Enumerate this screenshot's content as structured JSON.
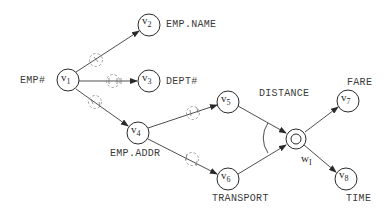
{
  "diagram": {
    "type": "semantic-network",
    "nodes": [
      {
        "id": "v1",
        "label": "v",
        "sub": "1",
        "annotation": "EMP#"
      },
      {
        "id": "v2",
        "label": "v",
        "sub": "2",
        "annotation": "EMP.NAME"
      },
      {
        "id": "v3",
        "label": "v",
        "sub": "3",
        "annotation": "DEPT#"
      },
      {
        "id": "v4",
        "label": "v",
        "sub": "4",
        "annotation": "EMP.ADDR"
      },
      {
        "id": "v5",
        "label": "v",
        "sub": "5",
        "annotation": ""
      },
      {
        "id": "v6",
        "label": "v",
        "sub": "6",
        "annotation": "TRANSPORT"
      },
      {
        "id": "wI",
        "label": "w",
        "sub": "I",
        "annotation": ""
      },
      {
        "id": "v7",
        "label": "v",
        "sub": "7",
        "annotation": "FARE"
      },
      {
        "id": "v8",
        "label": "v",
        "sub": "8",
        "annotation": "TIME"
      }
    ],
    "edges": [
      {
        "from": "v1",
        "to": "v2",
        "marker": "dashed-circle"
      },
      {
        "from": "v1",
        "to": "v3",
        "marker": "dashed-circle"
      },
      {
        "from": "v1",
        "to": "v4",
        "marker": "dashed-circle"
      },
      {
        "from": "v4",
        "to": "v5",
        "marker": "dashed-circle"
      },
      {
        "from": "v4",
        "to": "v6",
        "marker": "dashed-circle"
      },
      {
        "from": "v5",
        "to": "wI",
        "marker": "arc-join"
      },
      {
        "from": "v6",
        "to": "wI",
        "marker": "arc-join"
      },
      {
        "from": "wI",
        "to": "v7",
        "marker": ""
      },
      {
        "from": "wI",
        "to": "v8",
        "marker": ""
      }
    ],
    "labels": {
      "emp_num": "EMP#",
      "emp_name": "EMP.NAME",
      "dept_num": "DEPT#",
      "emp_addr": "EMP.ADDR",
      "distance": "DISTANCE",
      "transport": "TRANSPORT",
      "fare": "FARE",
      "time": "TIME"
    },
    "node_text": {
      "v": "v",
      "w": "w",
      "s1": "1",
      "s2": "2",
      "s3": "3",
      "s4": "4",
      "s5": "5",
      "s6": "6",
      "s7": "7",
      "s8": "8",
      "sI": "I"
    },
    "colors": {
      "stroke": "#2a2a2a",
      "dashed": "#8a8a8a",
      "background": "#ffffff"
    }
  }
}
